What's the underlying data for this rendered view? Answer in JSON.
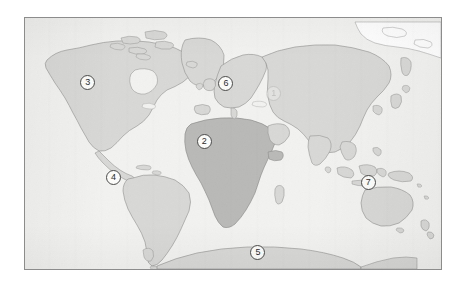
{
  "figure": {
    "kind": "world-map",
    "projection_note": "cylindrical world map, Antarctica along bottom edge"
  },
  "frame": {
    "border_color": "#8c8c8c",
    "ocean_color": "#f2f2f0",
    "page_background": "#ffffff"
  },
  "palette": {
    "land_light": "#d8d8d6",
    "land_dark": "#b9b9b7",
    "land_unfilled": "#ffffff",
    "coast_line": "#8f8f8f",
    "marker_fill": "#fbfbfa",
    "marker_stroke": "#4a4a4a",
    "marker_text": "#2b2b2b"
  },
  "markers": [
    {
      "id": "marker-asia",
      "label": "1",
      "region": "Asia",
      "x_pct": 59.8,
      "y_pct": 30.0,
      "faded": true
    },
    {
      "id": "marker-africa",
      "label": "2",
      "region": "Africa",
      "x_pct": 43.1,
      "y_pct": 49.4,
      "faded": false
    },
    {
      "id": "marker-north-america",
      "label": "3",
      "region": "North America",
      "x_pct": 15.1,
      "y_pct": 25.7,
      "faded": false
    },
    {
      "id": "marker-south-america",
      "label": "4",
      "region": "South America",
      "x_pct": 21.3,
      "y_pct": 63.6,
      "faded": false
    },
    {
      "id": "marker-antarctica",
      "label": "5",
      "region": "Antarctica",
      "x_pct": 56.0,
      "y_pct": 93.3,
      "faded": false
    },
    {
      "id": "marker-europe",
      "label": "6",
      "region": "Europe",
      "x_pct": 48.3,
      "y_pct": 26.1,
      "faded": false
    },
    {
      "id": "marker-oceania",
      "label": "7",
      "region": "Oceania / Pacific",
      "x_pct": 82.5,
      "y_pct": 65.6,
      "faded": false
    }
  ],
  "landmasses": [
    {
      "id": "north-america",
      "name": "North America",
      "shade": "light"
    },
    {
      "id": "greenland",
      "name": "Greenland",
      "shade": "light"
    },
    {
      "id": "arctic-north",
      "name": "Arctic / northern islands",
      "shade": "unfilled"
    },
    {
      "id": "south-america",
      "name": "South America",
      "shade": "light"
    },
    {
      "id": "africa",
      "name": "Africa",
      "shade": "dark"
    },
    {
      "id": "europe",
      "name": "Europe",
      "shade": "light"
    },
    {
      "id": "asia",
      "name": "Asia",
      "shade": "light"
    },
    {
      "id": "southeast-asia",
      "name": "Southeast Asia / Indonesia",
      "shade": "light"
    },
    {
      "id": "australia",
      "name": "Australia",
      "shade": "light"
    },
    {
      "id": "new-zealand",
      "name": "New Zealand",
      "shade": "light"
    },
    {
      "id": "japan",
      "name": "Japan",
      "shade": "light"
    },
    {
      "id": "madagascar",
      "name": "Madagascar",
      "shade": "light"
    },
    {
      "id": "antarctica",
      "name": "Antarctica",
      "shade": "light"
    }
  ]
}
